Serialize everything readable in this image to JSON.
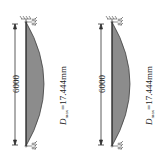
{
  "diagrams": [
    {
      "id": "left",
      "length_label": "6000",
      "dmax_symbol": "D",
      "dmax_subscript": "max",
      "dmax_value": "=17.444mm",
      "fill_color": "#8c8c8c"
    },
    {
      "id": "right",
      "length_label": "6000",
      "dmax_symbol": "D",
      "dmax_subscript": "max",
      "dmax_value": "=17.444mm",
      "fill_color": "#8c8c8c"
    }
  ]
}
